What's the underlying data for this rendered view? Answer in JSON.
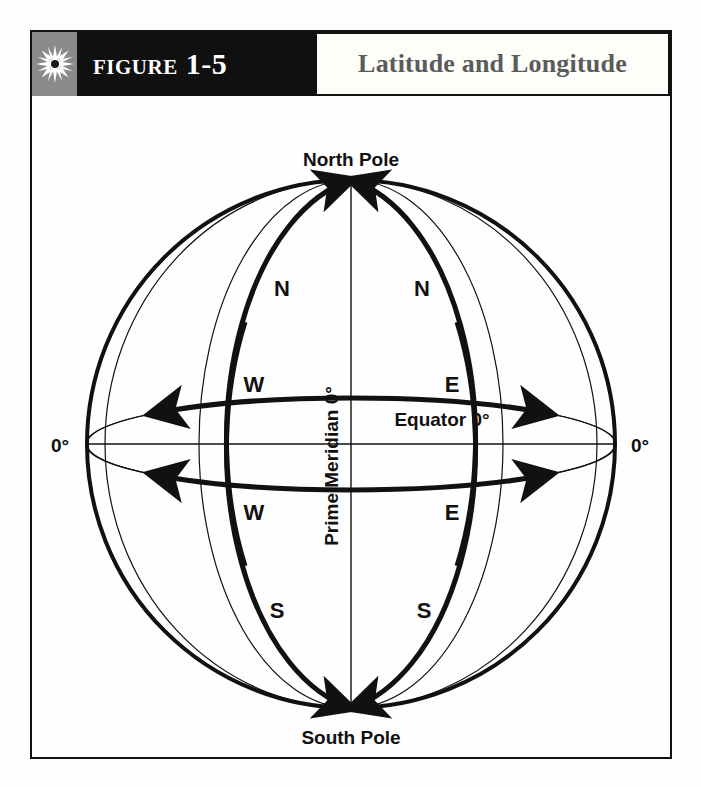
{
  "figure": {
    "number": "Figure 1-5",
    "title": "Latitude and Longitude",
    "icon": "sunburst-icon"
  },
  "diagram": {
    "type": "globe-graticule",
    "north_pole_label": "North Pole",
    "south_pole_label": "South Pole",
    "equator_label": "Equator 0°",
    "prime_meridian_label": "Prime Meridian 0°",
    "left_zero_label": "0°",
    "right_zero_label": "0°",
    "hemisphere_labels": {
      "north_west": "N",
      "north_east": "N",
      "south_west": "S",
      "south_east": "S",
      "longitude_west_upper": "W",
      "longitude_east_upper": "E",
      "longitude_west_lower": "W",
      "longitude_east_lower": "E"
    }
  },
  "colors": {
    "header_band": "#101010",
    "header_icon_bg": "#8a8a8a",
    "title_text": "#5b5b5b",
    "ink": "#111111",
    "paper": "#fefefe"
  }
}
